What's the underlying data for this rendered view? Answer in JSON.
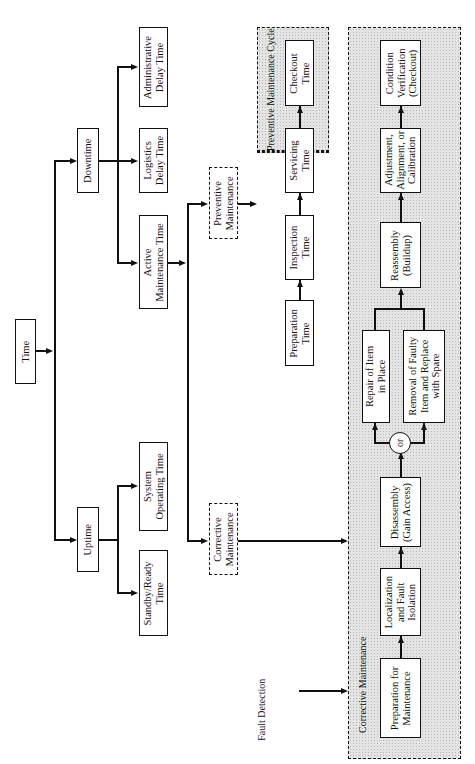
{
  "diagram": {
    "orientation": "rotated 90deg counter-clockwise",
    "root": "Time",
    "level1": {
      "uptime": "Uptime",
      "downtime": "Downtime"
    },
    "uptime_children": {
      "system_operating": "System\nOperating Time",
      "standby": "Standby/Ready\nTime"
    },
    "downtime_children": {
      "active_maintenance": "Active\nMaintenance Time",
      "logistics": "Logistics\nDelay Time",
      "administrative": "Administrative\nDelay Time"
    },
    "maintenance_types": {
      "preventive": "Preventive\nMaintenance",
      "corrective": "Corrective\nMaintenance"
    },
    "preventive_cycle": {
      "title": "Preventive Maintenance Cycle",
      "steps": [
        "Preparation\nTime",
        "Inspection\nTime",
        "Servicing\nTime",
        "Checkout\nTime"
      ]
    },
    "corrective_cycle": {
      "title": "Corrective Maintenance",
      "input_label": "Fault Detection",
      "steps": {
        "preparation": "Preparation for\nMaintenance",
        "localization": "Localization\nand Fault\nIsolation",
        "disassembly": "Disassembly\n(Gain Access)",
        "or_node": "or",
        "repair": "Repair of Item\nin Place",
        "removal": "Removal of Faulty\nItem and Replace\nwith Spare",
        "reassembly": "Reassembly\n(Buildup)",
        "adjustment": "Adjustment,\nAlignment, or\nCalibration",
        "verification": "Condition\nVerification\n(Checkout)"
      }
    }
  }
}
